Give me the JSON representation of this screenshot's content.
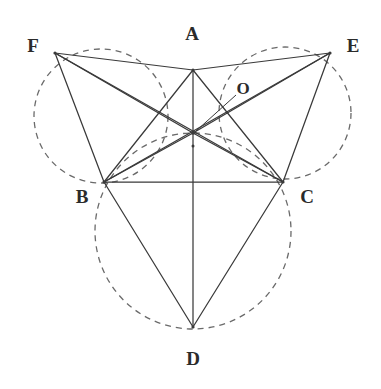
{
  "figure": {
    "type": "geometric-diagram",
    "canvas": {
      "width": 381,
      "height": 389,
      "background": "#ffffff"
    },
    "colors": {
      "solid_line": "#3a3a3a",
      "dashed_line": "#6a6a6a",
      "label_text": "#2b2b2b",
      "background": "#ffffff"
    },
    "points": [
      {
        "id": "A",
        "label": "A",
        "x": 193,
        "y": 70,
        "label_x": 192,
        "label_y": 33
      },
      {
        "id": "B",
        "label": "B",
        "x": 104,
        "y": 182,
        "label_x": 82,
        "label_y": 196
      },
      {
        "id": "C",
        "label": "C",
        "x": 283,
        "y": 182,
        "label_x": 307,
        "label_y": 196
      },
      {
        "id": "D",
        "label": "D",
        "x": 193,
        "y": 327,
        "label_x": 193,
        "label_y": 358
      },
      {
        "id": "E",
        "label": "E",
        "x": 330,
        "y": 53,
        "label_x": 353,
        "label_y": 45
      },
      {
        "id": "F",
        "label": "F",
        "x": 55,
        "y": 53,
        "label_x": 33,
        "label_y": 45
      },
      {
        "id": "O",
        "label": "O",
        "x": 193,
        "y": 133,
        "label_x": 243,
        "label_y": 88
      }
    ],
    "circles": [
      {
        "id": "circle-FAB",
        "cx": 101,
        "cy": 116,
        "r": 67,
        "through": "F, A, B, O",
        "style": "dashed"
      },
      {
        "id": "circle-AEC",
        "cx": 285,
        "cy": 113,
        "r": 66,
        "through": "A, E, C, O",
        "style": "dashed"
      },
      {
        "id": "circle-BCD",
        "cx": 193,
        "cy": 231,
        "r": 98,
        "through": "B, C, D, O",
        "style": "dashed"
      }
    ],
    "solid_segments": [
      {
        "id": "seg-FA",
        "from": "F",
        "to": "A"
      },
      {
        "id": "seg-AE",
        "from": "A",
        "to": "E"
      },
      {
        "id": "seg-FB",
        "from": "F",
        "to": "B"
      },
      {
        "id": "seg-FO",
        "from": "F",
        "to": "O"
      },
      {
        "id": "seg-FC",
        "from": "F",
        "to": "C"
      },
      {
        "id": "seg-EC",
        "from": "E",
        "to": "C"
      },
      {
        "id": "seg-EO",
        "from": "E",
        "to": "O"
      },
      {
        "id": "seg-EB",
        "from": "E",
        "to": "B"
      },
      {
        "id": "seg-AB",
        "from": "A",
        "to": "B"
      },
      {
        "id": "seg-AC",
        "from": "A",
        "to": "C"
      },
      {
        "id": "seg-AD",
        "from": "A",
        "to": "D"
      },
      {
        "id": "seg-BC",
        "from": "B",
        "to": "C"
      },
      {
        "id": "seg-BD",
        "from": "B",
        "to": "D"
      },
      {
        "id": "seg-CD",
        "from": "C",
        "to": "D"
      },
      {
        "id": "seg-OB",
        "from": "O",
        "to": "B"
      },
      {
        "id": "seg-OC",
        "from": "O",
        "to": "C"
      }
    ],
    "leader_line": {
      "id": "leader-O",
      "from_x": 236,
      "from_y": 95,
      "to_x": 196,
      "to_y": 131
    },
    "labels": {
      "A": "A",
      "B": "B",
      "C": "C",
      "D": "D",
      "E": "E",
      "F": "F",
      "O": "O"
    }
  }
}
